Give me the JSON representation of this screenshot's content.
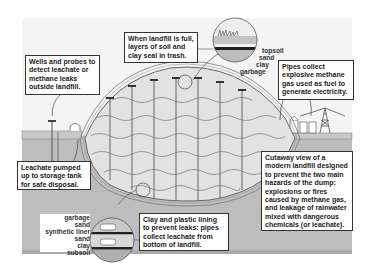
{
  "diagram": {
    "title": "Cutaway view of a modern landfill",
    "colors": {
      "background": "#ffffff",
      "sky_panel": "#f3f3f3",
      "ground": "#bdbdbd",
      "ground_dark": "#a8a8a8",
      "landfill_fill": "#e4e4e4",
      "lines": "#555555",
      "text": "#222222"
    },
    "callouts": {
      "wells": "Wells and probes to detect leachate or methane leaks outside landfill.",
      "cap": "When landfill is full, layers of soil and clay seal in trash.",
      "pipes": "Pipes collect explosive methane gas used as fuel to generate electricity.",
      "leachate_pump": "Leachate pumped up to storage tank for safe disposal.",
      "cutaway": "Cutaway view of a modern landfill designed to prevent the two main hazards of the dump: explosions or fires caused by methane gas, and leakage of rainwater mixed with dangerous chemicals (or leachate).",
      "lining": "Clay and plastic lining to prevent leaks: pipes collect leachate from bottom of landfill."
    },
    "top_layers": [
      "topsoil",
      "sand",
      "clay",
      "garbage"
    ],
    "bottom_layers": [
      "garbage",
      "sand",
      "synthetic liner",
      "sand",
      "clay",
      "subsoil"
    ]
  }
}
